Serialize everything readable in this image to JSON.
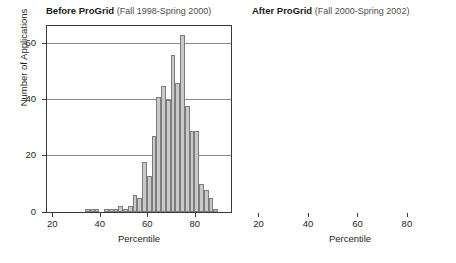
{
  "chart_data": [
    {
      "type": "bar",
      "panel": "left",
      "title": "Before ProGrid",
      "subtitle": "(Fall 1998-Spring 2000)",
      "xlabel": "Percentile",
      "ylabel": "Number of Applications",
      "xlim": [
        18,
        95
      ],
      "ylim": [
        0,
        66
      ],
      "xticks": [
        20,
        40,
        60,
        80
      ],
      "yticks": [
        0,
        20,
        40,
        60
      ],
      "gridlines": [
        20,
        40,
        60
      ],
      "grid": true,
      "bin_width": 2,
      "bin_centers": [
        19,
        21,
        23,
        25,
        27,
        29,
        31,
        33,
        35,
        37,
        39,
        41,
        43,
        45,
        47,
        49,
        51,
        53,
        55,
        57,
        59,
        61,
        63,
        65,
        67,
        69,
        71,
        73,
        75,
        77,
        79,
        81,
        83,
        85,
        87,
        89,
        91,
        93
      ],
      "values": [
        0,
        0,
        0,
        0,
        0,
        0,
        0,
        0,
        1,
        1,
        1,
        0,
        1,
        1,
        1,
        2,
        1,
        2,
        6,
        5,
        18,
        13,
        27,
        41,
        45,
        40,
        56,
        46,
        63,
        38,
        29,
        29,
        10,
        8,
        5,
        1,
        0,
        0
      ]
    },
    {
      "type": "bar",
      "panel": "right",
      "title": "After ProGrid",
      "subtitle": "(Fall 2000-Spring 2002)",
      "xlabel": "Percentile",
      "ylabel": "Number of Applications",
      "xlim": [
        18,
        96
      ],
      "ylim": [
        0,
        66
      ],
      "xticks": [
        20,
        40,
        60,
        80
      ],
      "yticks": [
        0,
        20,
        40,
        60
      ],
      "gridlines": [
        20,
        40,
        60
      ],
      "grid": true,
      "bin_width": 2,
      "bin_centers": [
        19,
        21,
        23,
        25,
        27,
        29,
        31,
        33,
        35,
        37,
        39,
        41,
        43,
        45,
        47,
        49,
        51,
        53,
        55,
        57,
        59,
        61,
        63,
        65,
        67,
        69,
        71,
        73,
        75,
        77,
        79,
        81,
        83,
        85,
        87,
        89,
        91,
        93,
        95
      ],
      "values": [
        1,
        1,
        2,
        1,
        5,
        2,
        7,
        6,
        6,
        10,
        12,
        13,
        20,
        16,
        22,
        27,
        19,
        24,
        33,
        30,
        35,
        26,
        28,
        22,
        29,
        15,
        15,
        9,
        5,
        2,
        4,
        3
      ],
      "values_note": "bars read left to right across the axis"
    }
  ],
  "axes": {
    "ylabel": "Number of Applications",
    "xlabel": "Percentile",
    "ytick_labels": [
      "0",
      "20",
      "40",
      "60"
    ],
    "xtick_labels": [
      "20",
      "40",
      "60",
      "80"
    ]
  },
  "colors": {
    "bar_fill": "#c9c9c9",
    "bar_stroke": "#7d7d7d",
    "frame": "#3a3a3a",
    "gridline": "#8c8c8c",
    "text": "#231f20",
    "subtitle_text": "#4d4d4d",
    "background": "#ffffff"
  },
  "panels": {
    "left": {
      "title_main": "Before ProGrid",
      "title_sub": "(Fall 1998-Spring 2000)"
    },
    "right": {
      "title_main": "After ProGrid",
      "title_sub": "(After titles) (Fall 2000-Spring 2002)"
    }
  }
}
